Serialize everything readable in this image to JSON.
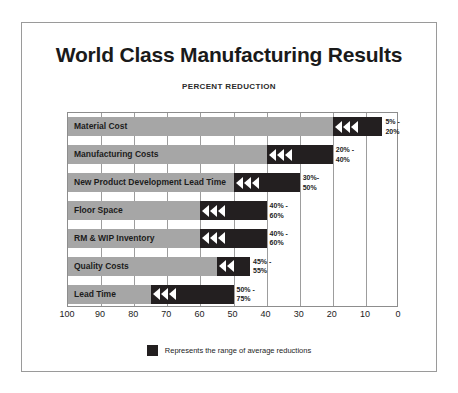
{
  "chart_data": {
    "type": "bar",
    "title": "World Class Manufacturing Results",
    "subtitle": "PERCENT REDUCTION",
    "xlabel": "",
    "ylabel": "",
    "xlim": [
      100,
      0
    ],
    "axis_reversed": true,
    "grid": true,
    "legend_position": "bottom-center",
    "tick_labels": [
      "100",
      "90",
      "80",
      "70",
      "60",
      "50",
      "40",
      "30",
      "20",
      "10",
      "0"
    ],
    "tick_values": [
      100,
      90,
      80,
      70,
      60,
      50,
      40,
      30,
      20,
      10,
      0
    ],
    "legend": [
      {
        "label": "Represents the range of average reductions",
        "color": "#231f20"
      }
    ],
    "colors": {
      "base_bar": "#a6a6a6",
      "range_bar": "#231f20",
      "arrow": "#ffffff",
      "grid": "#9d9d9d",
      "frame": "#9a9a9a",
      "text": "#1c1c1c"
    },
    "categories": [
      "Material Cost",
      "Manufacturing Costs",
      "New Product Development Lead Time",
      "Floor Space",
      "RM & WIP Inventory",
      "Quality Costs",
      "Lead Time"
    ],
    "rows": [
      {
        "label": "Material Cost",
        "range_min": 5,
        "range_max": 20,
        "range_label": "5% - 20%",
        "range_label_line1": "5% -",
        "range_label_line2": "20%",
        "arrows": 3
      },
      {
        "label": "Manufacturing Costs",
        "range_min": 20,
        "range_max": 40,
        "range_label": "20% - 40%",
        "range_label_line1": "20% -",
        "range_label_line2": "40%",
        "arrows": 3
      },
      {
        "label": "New Product Development Lead Time",
        "range_min": 30,
        "range_max": 50,
        "range_label": "30% - 50%",
        "range_label_line1": "30%-",
        "range_label_line2": "50%",
        "arrows": 3
      },
      {
        "label": "Floor Space",
        "range_min": 40,
        "range_max": 60,
        "range_label": "40% - 60%",
        "range_label_line1": "40% -",
        "range_label_line2": "60%",
        "arrows": 3
      },
      {
        "label": "RM & WIP Inventory",
        "range_min": 40,
        "range_max": 60,
        "range_label": "40% - 60%",
        "range_label_line1": "40% -",
        "range_label_line2": "60%",
        "arrows": 3
      },
      {
        "label": "Quality Costs",
        "range_min": 45,
        "range_max": 55,
        "range_label": "45% - 55%",
        "range_label_line1": "45% -",
        "range_label_line2": "55%",
        "arrows": 2
      },
      {
        "label": "Lead Time",
        "range_min": 50,
        "range_max": 75,
        "range_label": "50% - 75%",
        "range_label_line1": "50% -",
        "range_label_line2": "75%",
        "arrows": 3
      }
    ]
  }
}
